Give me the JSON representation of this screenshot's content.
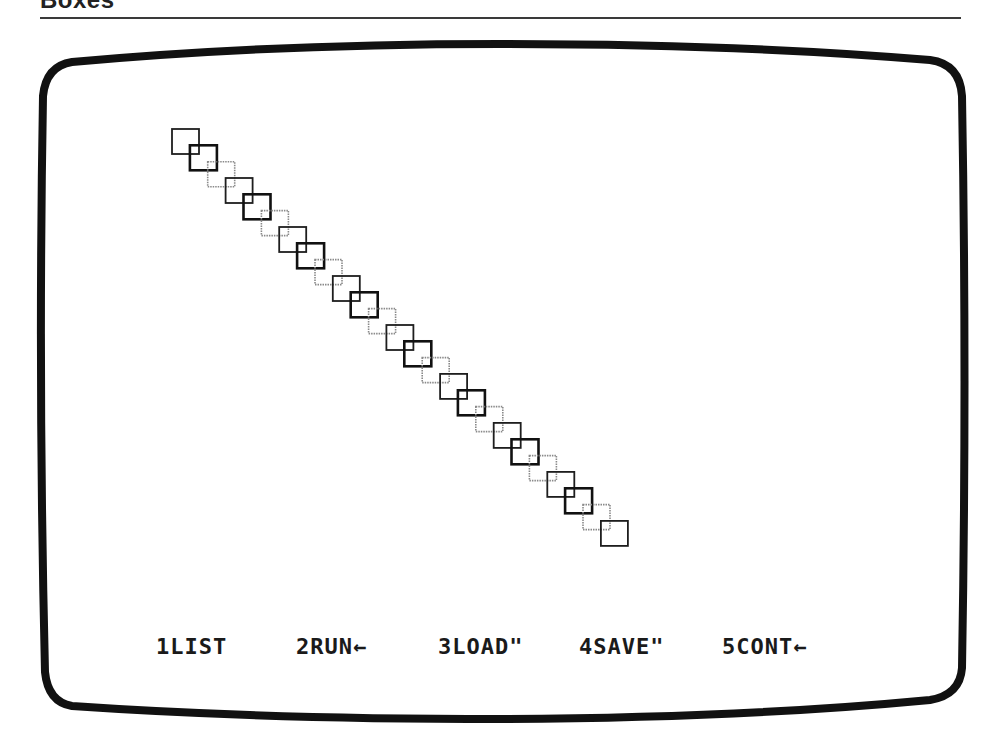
{
  "page": {
    "heading": "Boxes"
  },
  "screen": {
    "frame_color": "#111111",
    "background": "#ffffff",
    "boxes": {
      "count": 25,
      "start": {
        "x": 172,
        "y": 129
      },
      "step": {
        "dx": 17.87,
        "dy": 16.33
      },
      "size": {
        "w": 27,
        "h": 25
      },
      "style_cycle": [
        "medium",
        "thick",
        "dotted-gray"
      ],
      "colors": {
        "medium": "#1e1e1e",
        "thick": "#111111",
        "dotted-gray": "#8a8a8a"
      }
    },
    "function_keys": [
      {
        "key": "1",
        "label": "LIST"
      },
      {
        "key": "2",
        "label": "RUN←"
      },
      {
        "key": "3",
        "label": "LOAD\""
      },
      {
        "key": "4",
        "label": "SAVE\""
      },
      {
        "key": "5",
        "label": "CONT←"
      }
    ],
    "function_key_text": [
      "1LIST",
      "2RUN←",
      "3LOAD\"",
      "4SAVE\"",
      "5CONT←"
    ]
  }
}
